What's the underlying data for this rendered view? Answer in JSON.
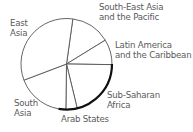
{
  "chart_data": {
    "type": "pie",
    "title": "",
    "start_angle_deg": 8,
    "direction": "clockwise",
    "slices": [
      {
        "label": "South-East Asia and the Pacific",
        "value": 14
      },
      {
        "label": "Latin America and the Caribbean",
        "value": 9
      },
      {
        "label": "Sub-Saharan Africa",
        "value": 21
      },
      {
        "label": "Arab States",
        "value": 4
      },
      {
        "label": "South Asia",
        "value": 19
      },
      {
        "label": "East Asia",
        "value": 33
      }
    ],
    "emphasized_arc": {
      "from_deg": 90,
      "to_deg": 190
    },
    "legend": "none (labels placed around pie)"
  },
  "labels": {
    "east_asia": [
      "East",
      "Asia"
    ],
    "sea_pacific": [
      "South-East Asia",
      "and the Pacific"
    ],
    "latin_america": [
      "Latin America",
      "and the Caribbean"
    ],
    "ssa": [
      "Sub-Saharan",
      "Africa"
    ],
    "south_asia": [
      "South",
      "Asia"
    ],
    "arab_states": [
      "Arab States"
    ]
  }
}
